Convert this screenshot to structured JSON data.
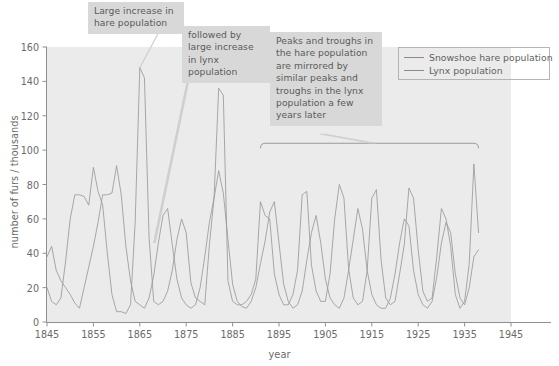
{
  "chart_data": {
    "type": "line",
    "title": "",
    "xlabel": "year",
    "ylabel": "number of furs / thousands",
    "xlim": [
      1845,
      1945
    ],
    "ylim": [
      0,
      160
    ],
    "xticks": [
      1845,
      1855,
      1865,
      1875,
      1885,
      1895,
      1905,
      1915,
      1925,
      1935,
      1945
    ],
    "yticks": [
      0,
      20,
      40,
      60,
      80,
      100,
      120,
      140,
      160
    ],
    "grid": false,
    "legend_position": "top-right",
    "legend": [
      "Snowshoe hare population",
      "Lynx population"
    ],
    "x": [
      1845,
      1846,
      1847,
      1848,
      1849,
      1850,
      1851,
      1852,
      1853,
      1854,
      1855,
      1856,
      1857,
      1858,
      1859,
      1860,
      1861,
      1862,
      1863,
      1864,
      1865,
      1866,
      1867,
      1868,
      1869,
      1870,
      1871,
      1872,
      1873,
      1874,
      1875,
      1876,
      1877,
      1878,
      1879,
      1880,
      1881,
      1882,
      1883,
      1884,
      1885,
      1886,
      1887,
      1888,
      1889,
      1890,
      1891,
      1892,
      1893,
      1894,
      1895,
      1896,
      1897,
      1898,
      1899,
      1900,
      1901,
      1902,
      1903,
      1904,
      1905,
      1906,
      1907,
      1908,
      1909,
      1910,
      1911,
      1912,
      1913,
      1914,
      1915,
      1916,
      1917,
      1918,
      1919,
      1920,
      1921,
      1922,
      1923,
      1924,
      1925,
      1926,
      1927,
      1928,
      1929,
      1930,
      1931,
      1932,
      1933,
      1934,
      1935,
      1936,
      1937,
      1938
    ],
    "series": [
      {
        "name": "Snowshoe hare population",
        "color": "#9a9a9a",
        "values": [
          20,
          12,
          10,
          14,
          35,
          60,
          74,
          74,
          73,
          68,
          90,
          76,
          68,
          40,
          16,
          6,
          6,
          5,
          10,
          58,
          148,
          142,
          49,
          12,
          10,
          12,
          18,
          30,
          48,
          60,
          52,
          23,
          14,
          12,
          10,
          45,
          72,
          136,
          132,
          24,
          12,
          10,
          10,
          12,
          16,
          25,
          70,
          62,
          60,
          28,
          16,
          10,
          10,
          16,
          30,
          74,
          76,
          33,
          18,
          12,
          12,
          28,
          60,
          80,
          72,
          31,
          14,
          10,
          12,
          30,
          72,
          77,
          36,
          14,
          10,
          12,
          28,
          45,
          78,
          72,
          42,
          18,
          12,
          14,
          38,
          66,
          60,
          44,
          16,
          8,
          12,
          34,
          92,
          52
        ]
      },
      {
        "name": "Lynx population",
        "color": "#9a9a9a",
        "values": [
          38,
          44,
          30,
          24,
          20,
          16,
          11,
          8,
          20,
          32,
          44,
          58,
          74,
          74,
          75,
          91,
          74,
          44,
          24,
          12,
          10,
          8,
          14,
          27,
          46,
          62,
          66,
          45,
          25,
          14,
          10,
          8,
          10,
          20,
          38,
          58,
          72,
          88,
          75,
          48,
          22,
          12,
          9,
          8,
          12,
          20,
          34,
          47,
          64,
          70,
          46,
          22,
          12,
          8,
          10,
          18,
          36,
          52,
          62,
          46,
          25,
          14,
          10,
          8,
          14,
          30,
          48,
          66,
          54,
          30,
          16,
          10,
          8,
          8,
          14,
          28,
          46,
          60,
          56,
          30,
          16,
          10,
          8,
          12,
          26,
          46,
          58,
          52,
          28,
          14,
          10,
          20,
          38,
          42
        ]
      }
    ],
    "annotations": [
      {
        "text": "Large increase in hare population",
        "target_x": 1865,
        "target_y": 148
      },
      {
        "text": "followed by large increase in lynx population",
        "target_x": 1869,
        "target_y": 46
      },
      {
        "text": "Peaks and troughs in the hare population are mirrored by similar peaks and troughs in the lynx population a few years later",
        "target_x": 1913,
        "target_y": 107
      }
    ],
    "bracket": {
      "x_start": 1891,
      "x_end": 1938,
      "y": 104
    }
  },
  "axis": {
    "xlabel": "year",
    "ylabel": "number of furs / thousands"
  }
}
